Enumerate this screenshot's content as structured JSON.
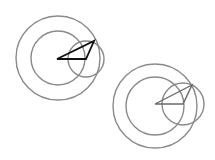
{
  "canvas": {
    "width": 215,
    "height": 160,
    "background": "#ffffff"
  },
  "colors": {
    "circle": "#8a8a8a",
    "triangle_1": "#111111",
    "triangle_2": "#6a6a6a"
  },
  "figures": [
    {
      "name": "figure-1",
      "circles": [
        {
          "cx": 58,
          "cy": 58,
          "r": 42
        },
        {
          "cx": 58,
          "cy": 58,
          "r": 27
        },
        {
          "cx": 86,
          "cy": 59,
          "r": 18
        }
      ],
      "triangle": {
        "points": [
          [
            57,
            59
          ],
          [
            94,
            41
          ],
          [
            86,
            59
          ]
        ]
      }
    },
    {
      "name": "figure-2",
      "circles": [
        {
          "cx": 155,
          "cy": 106,
          "r": 42
        },
        {
          "cx": 155,
          "cy": 106,
          "r": 29
        },
        {
          "cx": 183,
          "cy": 104,
          "r": 21
        }
      ],
      "triangle": {
        "points": [
          [
            155,
            104
          ],
          [
            192,
            85
          ],
          [
            183,
            104
          ]
        ]
      }
    }
  ]
}
